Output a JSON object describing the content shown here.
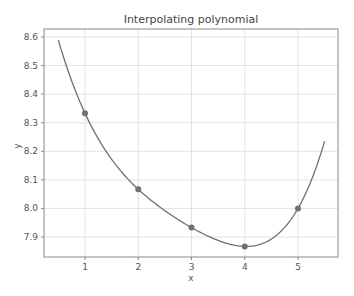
{
  "chart_data": {
    "type": "line",
    "title": "Interpolating polynomial",
    "xlabel": "x",
    "ylabel": "y",
    "xlim": [
      0.3,
      5.72
    ],
    "ylim": [
      7.826,
      8.628
    ],
    "grid": true,
    "x_ticks": [
      "1",
      "2",
      "3",
      "4",
      "5"
    ],
    "y_ticks": [
      "7.9",
      "8.0",
      "8.1",
      "8.2",
      "8.3",
      "8.4",
      "8.5",
      "8.6"
    ],
    "series": [
      {
        "name": "data points",
        "style": "markers",
        "x": [
          1,
          2,
          3,
          4,
          5
        ],
        "y": [
          8.333,
          8.067,
          7.933,
          7.867,
          8.0
        ]
      },
      {
        "name": "interpolating polynomial",
        "style": "line",
        "x_range": [
          0.5,
          5.5
        ]
      }
    ],
    "colors": {
      "line": "#707070",
      "marker": "#707070",
      "grid": "#e3e3e3",
      "axes": "#888888"
    }
  }
}
